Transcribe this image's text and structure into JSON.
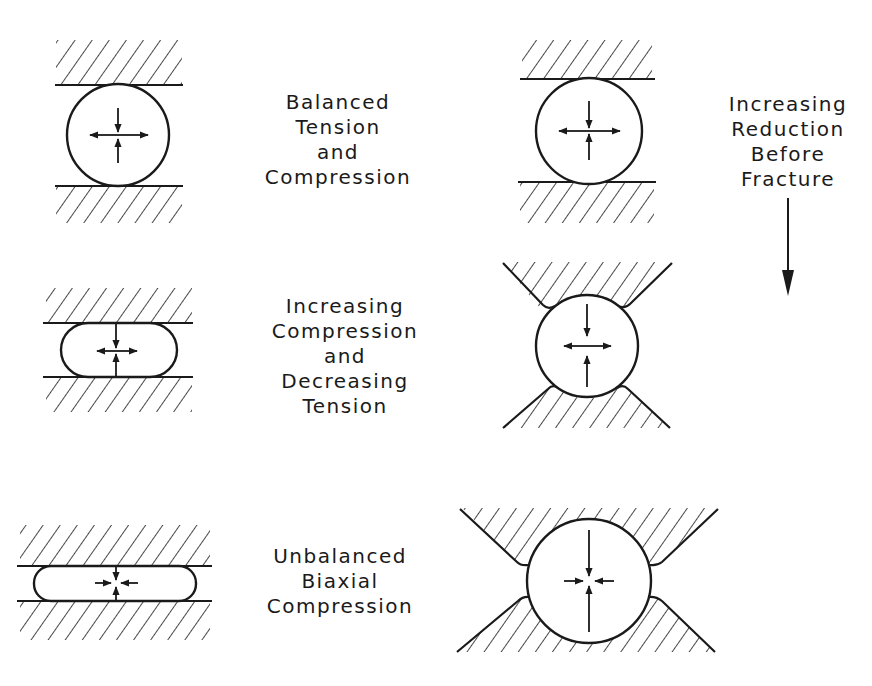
{
  "diagram": {
    "type": "schematic",
    "colors": {
      "ink": "#1a1a1a",
      "background": "#ffffff"
    },
    "labels": {
      "row1": [
        "Balanced",
        "Tension",
        "and",
        "Compression"
      ],
      "row2": [
        "Increasing",
        "Compression",
        "and",
        "Decreasing",
        "Tension"
      ],
      "row3": [
        "Unbalanced",
        "Biaxial",
        "Compression"
      ],
      "trend": [
        "Increasing",
        "Reduction",
        "Before",
        "Fracture"
      ]
    },
    "panels": [
      {
        "id": "flat-1",
        "column": "left",
        "row": 1,
        "shape": "circle between flat platens",
        "arrows": "horizontal outward, vertical inward"
      },
      {
        "id": "flat-2",
        "column": "left",
        "row": 2,
        "shape": "flattened capsule between flat platens",
        "arrows": "horizontal outward (short), vertical inward"
      },
      {
        "id": "flat-3",
        "column": "left",
        "row": 3,
        "shape": "thin capsule between flat platens",
        "arrows": "horizontal inward, vertical inward"
      },
      {
        "id": "groove-1",
        "column": "right",
        "row": 1,
        "shape": "circle between flat platens",
        "arrows": "horizontal outward, vertical inward"
      },
      {
        "id": "groove-2",
        "column": "right",
        "row": 2,
        "shape": "circle in V-groove dies",
        "arrows": "horizontal outward, vertical inward"
      },
      {
        "id": "groove-3",
        "column": "right",
        "row": 3,
        "shape": "circle in rounded V-groove dies",
        "arrows": "horizontal inward, vertical inward"
      }
    ],
    "trend_arrow": {
      "direction": "down"
    }
  }
}
